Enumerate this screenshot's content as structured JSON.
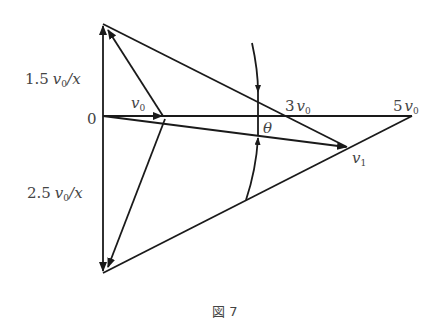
{
  "figure": {
    "caption": "図 7",
    "labels": {
      "origin": "0",
      "v0": "v",
      "v0_sub": "0",
      "three_v0_coef": "3",
      "five_v0_coef": "5",
      "v1": "v",
      "v1_sub": "1",
      "theta": "θ",
      "upper_coef": "1.5",
      "upper_suffix": "/x",
      "lower_coef": "2.5",
      "lower_suffix": "/x"
    },
    "colors": {
      "stroke": "#1a1a1a",
      "text": "#444444"
    }
  }
}
